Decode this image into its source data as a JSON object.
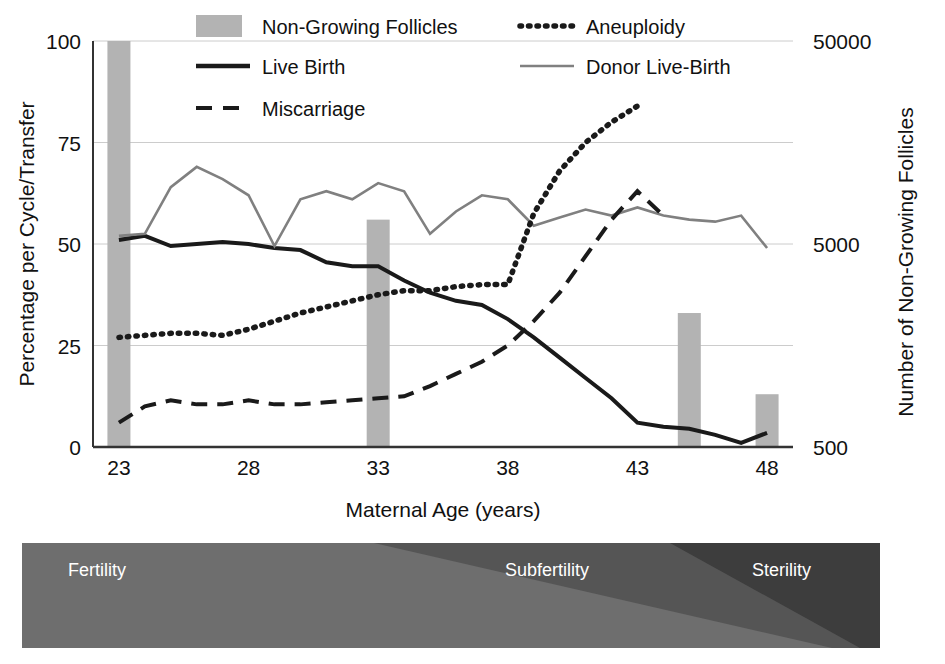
{
  "chart_data": {
    "type": "line",
    "title": "",
    "xlabel": "Maternal Age (years)",
    "ylabel": "Percentage per Cycle/Transfer",
    "y2label": "Number of Non-Growing Follicles",
    "xlim": [
      22,
      49
    ],
    "ylim": [
      0,
      100
    ],
    "xticks": [
      "23",
      "28",
      "33",
      "38",
      "43",
      "48"
    ],
    "xtick_values": [
      23,
      28,
      33,
      38,
      43,
      48
    ],
    "yticks": [
      "0",
      "25",
      "50",
      "75",
      "100"
    ],
    "ytick_values": [
      0,
      25,
      50,
      75,
      100
    ],
    "y2ticks": [
      "500",
      "5000",
      "50000"
    ],
    "y2tick_values": [
      500,
      5000,
      50000
    ],
    "y2_scale": "log",
    "grid": true,
    "legend_position": "top",
    "legend": [
      {
        "label": "Non-Growing Follicles",
        "marker": "bar",
        "color": "#b3b3b3"
      },
      {
        "label": "Aneuploidy",
        "marker": "dotted",
        "color": "#1a1a1a"
      },
      {
        "label": "Live Birth",
        "marker": "solid",
        "color": "#1a1a1a"
      },
      {
        "label": "Donor Live-Birth",
        "marker": "solid",
        "color": "#808080"
      },
      {
        "label": "Miscarriage",
        "marker": "dashed",
        "color": "#1a1a1a"
      }
    ],
    "bars": {
      "name": "Non-Growing Follicles",
      "axis": "right",
      "color": "#b3b3b3",
      "x": [
        23,
        33,
        45,
        48
      ],
      "percent_height": [
        100,
        56,
        33,
        13
      ],
      "follicle_values": [
        50000,
        5000,
        1400,
        700
      ]
    },
    "series": [
      {
        "name": "Live Birth",
        "style": "solid",
        "color": "#1a1a1a",
        "x": [
          23,
          24,
          25,
          26,
          27,
          28,
          29,
          30,
          31,
          32,
          33,
          34,
          35,
          36,
          37,
          38,
          39,
          40,
          41,
          42,
          43,
          44,
          45,
          46,
          47,
          48
        ],
        "values": [
          51,
          52,
          49.5,
          50,
          50.5,
          50,
          49,
          48.5,
          45.5,
          44.5,
          44.5,
          41,
          38,
          36,
          35,
          31.5,
          27,
          22,
          17,
          12,
          6,
          5,
          4.5,
          3,
          1,
          3.5
        ]
      },
      {
        "name": "Donor Live-Birth",
        "style": "solid",
        "color": "#808080",
        "x": [
          23,
          24,
          25,
          26,
          27,
          28,
          29,
          30,
          31,
          32,
          33,
          34,
          35,
          36,
          37,
          38,
          39,
          40,
          41,
          42,
          43,
          44,
          45,
          46,
          47,
          48
        ],
        "values": [
          52,
          52.5,
          64,
          69,
          66,
          62,
          49.5,
          61,
          63,
          61,
          65,
          63,
          52.5,
          58,
          62,
          61,
          54.5,
          56.5,
          58.5,
          57,
          59,
          57,
          56,
          55.5,
          57,
          49
        ]
      },
      {
        "name": "Aneuploidy",
        "style": "dotted",
        "color": "#1a1a1a",
        "x": [
          23,
          24,
          25,
          26,
          27,
          28,
          29,
          30,
          31,
          32,
          33,
          34,
          35,
          36,
          37,
          38,
          39,
          40,
          41,
          42,
          43
        ],
        "values": [
          27,
          27.5,
          28,
          28,
          27.5,
          29,
          31,
          33,
          34.5,
          36,
          37.5,
          38.5,
          38.5,
          39.5,
          40,
          40,
          57.5,
          68,
          75,
          80,
          84
        ]
      },
      {
        "name": "Miscarriage",
        "style": "dashed",
        "color": "#1a1a1a",
        "x": [
          23,
          24,
          25,
          26,
          27,
          28,
          29,
          30,
          31,
          32,
          33,
          34,
          35,
          36,
          37,
          38,
          39,
          40,
          41,
          42,
          43,
          44
        ],
        "values": [
          6,
          10,
          11.5,
          10.5,
          10.5,
          11.5,
          10.5,
          10.5,
          11,
          11.5,
          12,
          12.5,
          15,
          18,
          21,
          25,
          31,
          38,
          47,
          56,
          63,
          57
        ]
      }
    ]
  },
  "fertility_band": {
    "segments": [
      {
        "label": "Fertility",
        "color": "#6e6e6e"
      },
      {
        "label": "Subfertility",
        "color": "#555555"
      },
      {
        "label": "Sterility",
        "color": "#3d3d3d"
      }
    ]
  }
}
